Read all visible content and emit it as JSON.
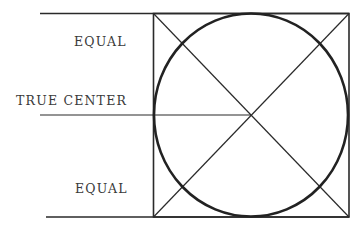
{
  "diagram": {
    "labels": {
      "top": "EQUAL",
      "center": "TRUE CENTER",
      "bottom": "EQUAL"
    },
    "colors": {
      "ink": "#2a2a2a",
      "background": "#ffffff"
    },
    "geometry": {
      "square": {
        "x": 153,
        "y": 13,
        "width": 196,
        "height": 204
      },
      "circle": {
        "cx": 251,
        "cy": 115,
        "rx": 97,
        "ry": 101
      },
      "center_line_y": 115
    }
  }
}
